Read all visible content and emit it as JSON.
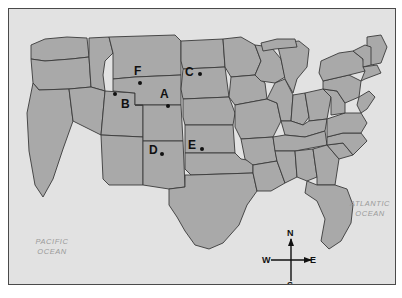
{
  "map": {
    "title": "United States political map with labeled locations",
    "colors": {
      "water": "#e2e2e2",
      "land": "#a9a9a9",
      "state_border": "#3a3a3a",
      "frame": "#4a4a4a",
      "marker": "#111111",
      "ocean_text": "#9a9a9a"
    },
    "ocean_labels": [
      {
        "id": "pacific",
        "text": "PACIFIC\nOCEAN"
      },
      {
        "id": "atlantic",
        "text": "ATLANTIC\nOCEAN"
      }
    ],
    "points": [
      {
        "id": "A",
        "label": "A"
      },
      {
        "id": "B",
        "label": "B"
      },
      {
        "id": "C",
        "label": "C"
      },
      {
        "id": "D",
        "label": "D"
      },
      {
        "id": "E",
        "label": "E"
      },
      {
        "id": "F",
        "label": "F"
      }
    ],
    "compass": {
      "north": "N",
      "south": "S",
      "west": "W",
      "east": "E"
    }
  }
}
